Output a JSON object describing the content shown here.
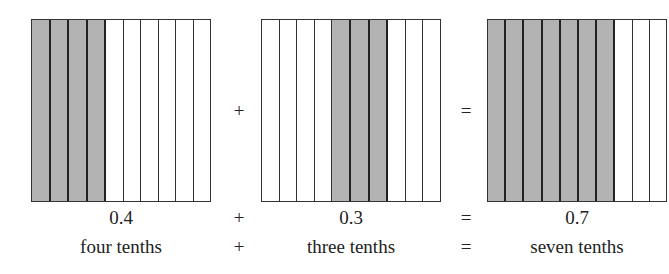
{
  "panels": [
    {
      "shaded": [
        0,
        1,
        2,
        3
      ],
      "value": "0.4",
      "words": "four tenths"
    },
    {
      "shaded": [
        4,
        5,
        6
      ],
      "value": "0.3",
      "words": "three tenths"
    },
    {
      "shaded": [
        0,
        1,
        2,
        3,
        4,
        5,
        6
      ],
      "value": "0.7",
      "words": "seven tenths"
    }
  ],
  "columns_per_grid": 10,
  "operators": {
    "plus": "+",
    "equals": "="
  },
  "colors": {
    "shaded": "#b3b3b3",
    "border": "#333333"
  }
}
